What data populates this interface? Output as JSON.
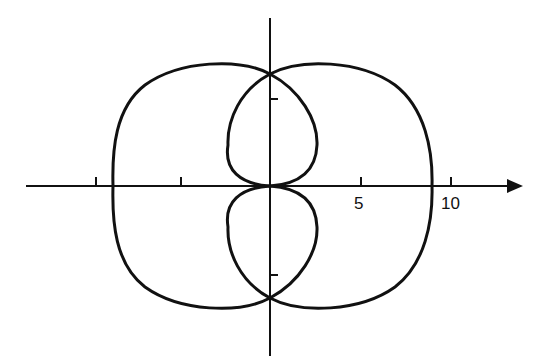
{
  "figure": {
    "type": "polar-curve-plot",
    "stroke_color": "#111111",
    "background": "#ffffff",
    "axes": {
      "origin_px": [
        270,
        186
      ],
      "px_per_unit": 18.1,
      "x_axis": {
        "arrow": true,
        "ticks": [
          -10,
          -5,
          5,
          10
        ],
        "labeled_ticks": [
          "5",
          "10"
        ]
      },
      "y_axis": {
        "arrow": false,
        "ticks": [
          5,
          -5
        ]
      }
    },
    "labels": {
      "tick_5": "5",
      "tick_10": "10"
    },
    "curve": {
      "description": "Closed symmetric curve with two large outer lobes and two small inner loops meeting at the origin",
      "outer_x_intercepts": [
        -8.8,
        8.8
      ],
      "y_crossings": [
        6.1,
        -6.1
      ],
      "inner_loop_half_width": 2.6
    }
  }
}
